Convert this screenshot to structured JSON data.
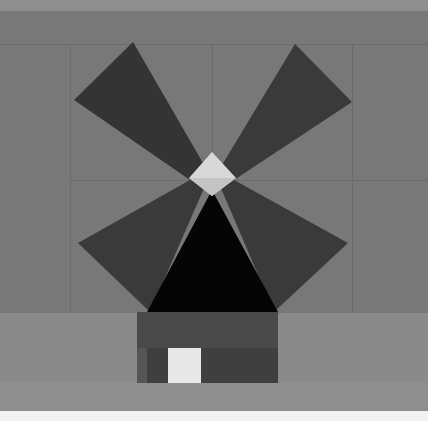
{
  "scene": {
    "title": "Windmill",
    "subject": "windmill-front-elevation",
    "canvas": {
      "width": 428,
      "height": 421
    },
    "palette": {
      "top_band": "#8f8f8f",
      "background_upper": "#787878",
      "background_lower": "#7c7c7c",
      "ground_band": "#8a8a8a",
      "bottom_strip": "#f2f2f2",
      "grid_line": "#646464",
      "sail_dark": "#343434",
      "sail_darker": "#2b2b2b",
      "cone_black": "#050505",
      "hub_light": "#d8d8d8",
      "hub_mid": "#bdbdbd",
      "base_body": "#4a4a4a",
      "base_lower": "#3f3f3f",
      "base_shadow_left": "#555555",
      "door_light": "#e8e8e8",
      "edge_highlight": "#9a9a9a"
    },
    "regions": [
      {
        "name": "top-light-band",
        "y": 0,
        "height": 11,
        "color": "#8f8f8f"
      },
      {
        "name": "sky-upper",
        "y": 11,
        "height": 301,
        "color": "#787878"
      },
      {
        "name": "ground-band",
        "y": 312,
        "height": 71,
        "color": "#8a8a8a"
      },
      {
        "name": "lower-band",
        "y": 383,
        "height": 28,
        "color": "#8f8f8f"
      },
      {
        "name": "bottom-white-strip",
        "y": 411,
        "height": 10,
        "color": "#f2f2f2"
      }
    ],
    "grid_lines": [
      {
        "name": "horizontal-upper",
        "orientation": "horizontal",
        "y": 44,
        "x1": 0,
        "x2": 428
      },
      {
        "name": "horizontal-center",
        "orientation": "horizontal",
        "y": 180,
        "x1": 68,
        "x2": 428
      },
      {
        "name": "horizontal-lower",
        "orientation": "horizontal",
        "y": 312,
        "x1": 0,
        "x2": 428
      },
      {
        "name": "vertical-left",
        "orientation": "vertical",
        "x": 70,
        "y1": 44,
        "y2": 312
      },
      {
        "name": "vertical-center",
        "orientation": "vertical",
        "x": 212,
        "y1": 44,
        "y2": 180
      },
      {
        "name": "vertical-right",
        "orientation": "vertical",
        "x": 352,
        "y1": 44,
        "y2": 312
      }
    ],
    "sails": [
      {
        "name": "sail-upper-left",
        "points": "207,170 133,42 74,100 190,180",
        "color": "#343434"
      },
      {
        "name": "sail-upper-right",
        "points": "219,170 295,44 352,102 234,180",
        "color": "#3a3a3a"
      },
      {
        "name": "sail-lower-left",
        "points": "205,186 150,312 78,243 190,180",
        "color": "#3a3a3a"
      },
      {
        "name": "sail-lower-right",
        "points": "220,186 274,312 348,243 234,180",
        "color": "#3a3a3a"
      }
    ],
    "cone": {
      "name": "mill-cap-cone",
      "points": "212,190 278,312 147,312",
      "color": "#050505"
    },
    "hub": {
      "name": "hub-diamond",
      "points": "212,152 236,178 212,196 189,178",
      "color": "#d8d8d8"
    },
    "base": {
      "name": "mill-base",
      "x": 137,
      "y": 312,
      "width": 141,
      "height": 71,
      "color": "#4a4a4a",
      "lower_band": {
        "y": 348,
        "height": 35,
        "color": "#3f3f3f"
      },
      "left_shadow": {
        "x": 137,
        "width": 10,
        "color": "#555555"
      }
    },
    "door": {
      "name": "mill-door",
      "x": 168,
      "y": 348,
      "width": 33,
      "height": 35,
      "color": "#e8e8e8"
    }
  }
}
